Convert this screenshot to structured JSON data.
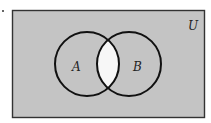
{
  "diagram": {
    "type": "venn",
    "universe_label": "U",
    "sets": [
      {
        "label": "A"
      },
      {
        "label": "B"
      }
    ],
    "shaded_region": "complement of A∩B (everything except the intersection)",
    "unshaded_region": "A∩B",
    "colors": {
      "shade": "#c4c4c4",
      "unshaded": "#f7f7f7",
      "stroke": "#111111",
      "border": "#333333"
    }
  }
}
